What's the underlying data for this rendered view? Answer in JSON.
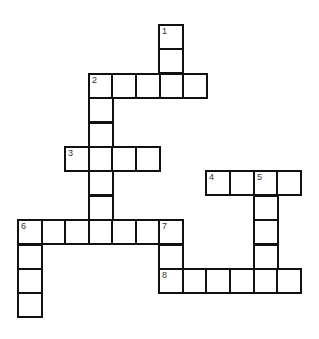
{
  "puzzle": {
    "type": "crossword",
    "grid_cols": 12,
    "grid_rows": 12,
    "cell_size": 24,
    "origin": {
      "x": 17,
      "y": 24
    },
    "colors": {
      "border": "#111111",
      "cell": "#ffffff",
      "number": "#333333"
    },
    "entries": [
      {
        "number": "1",
        "direction": "down",
        "row": 0,
        "col": 6,
        "length": 3
      },
      {
        "number": "2",
        "direction": "across",
        "row": 2,
        "col": 3,
        "length": 5
      },
      {
        "number": "2",
        "direction": "down",
        "row": 2,
        "col": 3,
        "length": 7
      },
      {
        "number": "3",
        "direction": "across",
        "row": 5,
        "col": 2,
        "length": 4
      },
      {
        "number": "4",
        "direction": "across",
        "row": 6,
        "col": 8,
        "length": 4
      },
      {
        "number": "5",
        "direction": "down",
        "row": 6,
        "col": 10,
        "length": 5
      },
      {
        "number": "6",
        "direction": "across",
        "row": 8,
        "col": 0,
        "length": 7
      },
      {
        "number": "6",
        "direction": "down",
        "row": 8,
        "col": 0,
        "length": 4
      },
      {
        "number": "7",
        "direction": "down",
        "row": 8,
        "col": 6,
        "length": 3
      },
      {
        "number": "8",
        "direction": "across",
        "row": 10,
        "col": 6,
        "length": 6
      }
    ]
  }
}
